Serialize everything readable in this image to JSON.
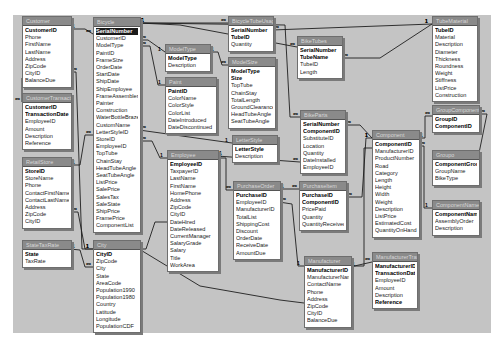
{
  "diagram": {
    "type": "database-relationships",
    "background_color": "#c4c4c4",
    "tables": [
      {
        "id": "customer",
        "title": "Customer",
        "x": 22,
        "y": 16,
        "w": 48,
        "fields": [
          {
            "name": "CustomerID",
            "key": true
          },
          {
            "name": "Phone"
          },
          {
            "name": "FirstName"
          },
          {
            "name": "LastName"
          },
          {
            "name": "Address"
          },
          {
            "name": "ZipCode"
          },
          {
            "name": "CityID"
          },
          {
            "name": "BalanceDue"
          }
        ]
      },
      {
        "id": "customertransaction",
        "title": "CustomerTransaction",
        "x": 22,
        "y": 93,
        "w": 48,
        "fields": [
          {
            "name": "CustomerID",
            "key": true
          },
          {
            "name": "TransactionDate",
            "key": true
          },
          {
            "name": "EmployeeID"
          },
          {
            "name": "Amount"
          },
          {
            "name": "Description"
          },
          {
            "name": "Reference"
          }
        ]
      },
      {
        "id": "retailstore",
        "title": "RetailStore",
        "x": 22,
        "y": 157,
        "w": 48,
        "fields": [
          {
            "name": "StoreID",
            "key": true
          },
          {
            "name": "StoreName"
          },
          {
            "name": "Phone"
          },
          {
            "name": "ContactFirstName"
          },
          {
            "name": "ContactLastName"
          },
          {
            "name": "Address"
          },
          {
            "name": "ZipCode"
          },
          {
            "name": "CityID"
          }
        ]
      },
      {
        "id": "statetaxrate",
        "title": "StateTaxRate",
        "x": 22,
        "y": 240,
        "w": 48,
        "fields": [
          {
            "name": "State",
            "key": true
          },
          {
            "name": "TaxRate"
          }
        ]
      },
      {
        "id": "bicycle",
        "title": "Bicycle",
        "x": 93,
        "y": 17,
        "w": 46,
        "fields": [
          {
            "name": "SerialNumber",
            "key": true,
            "selected": true
          },
          {
            "name": "CustomerID"
          },
          {
            "name": "ModelType"
          },
          {
            "name": "PaintID"
          },
          {
            "name": "FrameSize"
          },
          {
            "name": "OrderDate"
          },
          {
            "name": "StartDate"
          },
          {
            "name": "ShipDate"
          },
          {
            "name": "ShipEmployee"
          },
          {
            "name": "FrameAssembler"
          },
          {
            "name": "Painter"
          },
          {
            "name": "Construction"
          },
          {
            "name": "WaterBottleBrazeOn"
          },
          {
            "name": "CustomName"
          },
          {
            "name": "LetterStyleID"
          },
          {
            "name": "StoreID"
          },
          {
            "name": "EmployeeID"
          },
          {
            "name": "TopTube"
          },
          {
            "name": "ChainStay"
          },
          {
            "name": "HeadTubeAngle"
          },
          {
            "name": "SeatTubeAngle"
          },
          {
            "name": "ListPrice"
          },
          {
            "name": "SalePrice"
          },
          {
            "name": "SalesTax"
          },
          {
            "name": "SaleState"
          },
          {
            "name": "ShipPrice"
          },
          {
            "name": "FramePrice"
          },
          {
            "name": "ComponentList"
          }
        ]
      },
      {
        "id": "city",
        "title": "City",
        "x": 93,
        "y": 240,
        "w": 46,
        "fields": [
          {
            "name": "CityID",
            "key": true
          },
          {
            "name": "ZipCode"
          },
          {
            "name": "City"
          },
          {
            "name": "State"
          },
          {
            "name": "AreaCode"
          },
          {
            "name": "Population1990"
          },
          {
            "name": "Population1980"
          },
          {
            "name": "Country"
          },
          {
            "name": "Latitude"
          },
          {
            "name": "Longitude"
          },
          {
            "name": "PopulationCDF"
          }
        ]
      },
      {
        "id": "modeltype",
        "title": "ModelType",
        "x": 165,
        "y": 44,
        "w": 44,
        "fields": [
          {
            "name": "ModelType",
            "key": true
          },
          {
            "name": "Description"
          }
        ]
      },
      {
        "id": "paint",
        "title": "Paint",
        "x": 165,
        "y": 77,
        "w": 50,
        "fields": [
          {
            "name": "PaintID",
            "key": true
          },
          {
            "name": "ColorName"
          },
          {
            "name": "ColorStyle"
          },
          {
            "name": "ColorList"
          },
          {
            "name": "DateIntroduced"
          },
          {
            "name": "DateDiscontinued"
          }
        ]
      },
      {
        "id": "employee",
        "title": "Employee",
        "x": 167,
        "y": 150,
        "w": 50,
        "fields": [
          {
            "name": "EmployeeID",
            "key": true
          },
          {
            "name": "TaxpayerID"
          },
          {
            "name": "LastName"
          },
          {
            "name": "FirstName"
          },
          {
            "name": "HomePhone"
          },
          {
            "name": "Address"
          },
          {
            "name": "ZipCode"
          },
          {
            "name": "CityID"
          },
          {
            "name": "DateHired"
          },
          {
            "name": "DateReleased"
          },
          {
            "name": "CurrentManager"
          },
          {
            "name": "SalaryGrade"
          },
          {
            "name": "Salary"
          },
          {
            "name": "Title"
          },
          {
            "name": "WorkArea"
          }
        ]
      },
      {
        "id": "bicycletubeusage",
        "title": "BicycleTubeUsage",
        "x": 228,
        "y": 16,
        "w": 44,
        "fields": [
          {
            "name": "SerialNumber",
            "key": true
          },
          {
            "name": "TubeID",
            "key": true
          },
          {
            "name": "Quantity"
          }
        ]
      },
      {
        "id": "modelsize",
        "title": "ModelSize",
        "x": 228,
        "y": 57,
        "w": 46,
        "fields": [
          {
            "name": "ModelType",
            "key": true
          },
          {
            "name": "Size",
            "key": true
          },
          {
            "name": "TopTube"
          },
          {
            "name": "ChainStay"
          },
          {
            "name": "TotalLength"
          },
          {
            "name": "GroundClearance"
          },
          {
            "name": "HeadTubeAngle"
          },
          {
            "name": "SeatTubeAngle"
          }
        ]
      },
      {
        "id": "letterstyle",
        "title": "LetterStyle",
        "x": 232,
        "y": 135,
        "w": 44,
        "fields": [
          {
            "name": "LetterStyle",
            "key": true
          },
          {
            "name": "Description"
          }
        ]
      },
      {
        "id": "purchaseorder",
        "title": "PurchaseOrder",
        "x": 233,
        "y": 181,
        "w": 46,
        "fields": [
          {
            "name": "PurchaseID",
            "key": true
          },
          {
            "name": "EmployeeID"
          },
          {
            "name": "ManufacturerID"
          },
          {
            "name": "TotalList"
          },
          {
            "name": "ShippingCost"
          },
          {
            "name": "Discount"
          },
          {
            "name": "OrderDate"
          },
          {
            "name": "ReceiveDate"
          },
          {
            "name": "AmountDue"
          }
        ]
      },
      {
        "id": "biketubes",
        "title": "BikeTubes",
        "x": 297,
        "y": 36,
        "w": 44,
        "fields": [
          {
            "name": "SerialNumber",
            "key": true
          },
          {
            "name": "TubeName",
            "key": true
          },
          {
            "name": "TubeID"
          },
          {
            "name": "Length"
          }
        ]
      },
      {
        "id": "bikeparts",
        "title": "BikeParts",
        "x": 300,
        "y": 110,
        "w": 44,
        "fields": [
          {
            "name": "SerialNumber",
            "key": true
          },
          {
            "name": "ComponentID",
            "key": true
          },
          {
            "name": "SubstituteID"
          },
          {
            "name": "Location"
          },
          {
            "name": "Quantity"
          },
          {
            "name": "DateInstalled"
          },
          {
            "name": "EmployeeID"
          }
        ]
      },
      {
        "id": "purchaseitem",
        "title": "PurchaseItem",
        "x": 299,
        "y": 181,
        "w": 46,
        "fields": [
          {
            "name": "PurchaseID",
            "key": true
          },
          {
            "name": "ComponentID",
            "key": true
          },
          {
            "name": "PricePaid"
          },
          {
            "name": "Quantity"
          },
          {
            "name": "QuantityReceived"
          }
        ]
      },
      {
        "id": "manufacturer",
        "title": "Manufacturer",
        "x": 304,
        "y": 256,
        "w": 46,
        "fields": [
          {
            "name": "ManufacturerID",
            "key": true
          },
          {
            "name": "ManufacturerName"
          },
          {
            "name": "ContactName"
          },
          {
            "name": "Phone"
          },
          {
            "name": "Address"
          },
          {
            "name": "ZipCode"
          },
          {
            "name": "CityID"
          },
          {
            "name": "BalanceDue"
          }
        ]
      },
      {
        "id": "component",
        "title": "Component",
        "x": 372,
        "y": 130,
        "w": 46,
        "fields": [
          {
            "name": "ComponentID",
            "key": true
          },
          {
            "name": "ManufacturerID"
          },
          {
            "name": "ProductNumber"
          },
          {
            "name": "Road"
          },
          {
            "name": "Category"
          },
          {
            "name": "Length"
          },
          {
            "name": "Height"
          },
          {
            "name": "Width"
          },
          {
            "name": "Weight"
          },
          {
            "name": "Description"
          },
          {
            "name": "ListPrice"
          },
          {
            "name": "EstimatedCost"
          },
          {
            "name": "QuantityOnHand"
          }
        ]
      },
      {
        "id": "manufacturertransaction",
        "title": "ManufacturerTransaction",
        "x": 372,
        "y": 252,
        "w": 44,
        "fields": [
          {
            "name": "ManufacturerID",
            "key": true
          },
          {
            "name": "TransactionDate",
            "key": true
          },
          {
            "name": "EmployeeID"
          },
          {
            "name": "Amount"
          },
          {
            "name": "Description"
          },
          {
            "name": "Reference",
            "key": true
          }
        ]
      },
      {
        "id": "tubematerial",
        "title": "TubeMaterial",
        "x": 432,
        "y": 16,
        "w": 44,
        "fields": [
          {
            "name": "TubeID",
            "key": true
          },
          {
            "name": "Material"
          },
          {
            "name": "Description"
          },
          {
            "name": "Diameter"
          },
          {
            "name": "Thickness"
          },
          {
            "name": "Roundness"
          },
          {
            "name": "Weight"
          },
          {
            "name": "Stiffness"
          },
          {
            "name": "ListPrice"
          },
          {
            "name": "Construction"
          }
        ]
      },
      {
        "id": "groupcomponents",
        "title": "GroupComponents",
        "x": 432,
        "y": 105,
        "w": 46,
        "fields": [
          {
            "name": "GroupID",
            "key": true
          },
          {
            "name": "ComponentID",
            "key": true
          }
        ]
      },
      {
        "id": "groupo",
        "title": "Groupo",
        "x": 432,
        "y": 150,
        "w": 46,
        "fields": [
          {
            "name": "ComponentGroupID",
            "key": true
          },
          {
            "name": "GroupName"
          },
          {
            "name": "BikeType"
          }
        ]
      },
      {
        "id": "componentname",
        "title": "ComponentName",
        "x": 432,
        "y": 200,
        "w": 46,
        "fields": [
          {
            "name": "ComponentName",
            "key": true
          },
          {
            "name": "AssemblyOrder"
          },
          {
            "name": "Description"
          }
        ]
      }
    ],
    "relationships": [
      {
        "from": "customer",
        "to": "bicycle",
        "from_card": "1",
        "to_card": "∞",
        "path": "70,29 85,29 93,34"
      },
      {
        "from": "customer",
        "to": "customertransaction",
        "from_card": "1",
        "to_card": "∞",
        "path": "22,78 22,102"
      },
      {
        "from": "bicycle",
        "to": "bicycletubeusage",
        "from_card": "1",
        "to_card": "∞",
        "path": "139,23 228,23"
      },
      {
        "from": "bicycle",
        "to": "biketubes",
        "from_card": "1",
        "to_card": "∞",
        "path": "139,23 180,25 297,47"
      },
      {
        "from": "bicycle",
        "to": "modeltype",
        "from_card": "∞",
        "to_card": "1",
        "path": "139,40 148,40 165,52"
      },
      {
        "from": "bicycle",
        "to": "paint",
        "from_card": "∞",
        "to_card": "1",
        "path": "139,46 150,46 158,85 165,85"
      },
      {
        "from": "bicycle",
        "to": "letterstyle",
        "from_card": "∞",
        "to_card": "1",
        "path": "139,130 232,143"
      },
      {
        "from": "bicycle",
        "to": "employee",
        "from_card": "∞",
        "to_card": "1",
        "path": "139,141 152,141 160,158 167,158"
      },
      {
        "from": "bicycle",
        "to": "bikeparts",
        "from_card": "1",
        "to_card": "∞",
        "path": "139,23 285,25 290,117 300,117"
      },
      {
        "from": "retailstore",
        "to": "bicycle",
        "from_card": "1",
        "to_card": "∞",
        "path": "70,165 80,165 85,135 93,135"
      },
      {
        "from": "retailstore",
        "to": "city",
        "from_card": "∞",
        "to_card": "1",
        "path": "70,212 78,212 85,249 93,249"
      },
      {
        "from": "statetaxrate",
        "to": "city",
        "from_card": "1",
        "to_card": "∞",
        "path": "70,249 80,250 85,267 93,267"
      },
      {
        "from": "customer",
        "to": "city",
        "from_card": "∞",
        "to_card": "1",
        "path": "70,72 76,72 82,249 93,249"
      },
      {
        "from": "employee",
        "to": "city",
        "from_card": "∞",
        "to_card": "1",
        "path": "167,222 155,222 146,249 139,249"
      },
      {
        "from": "modeltype",
        "to": "modelsize",
        "from_card": "1",
        "to_card": "∞",
        "path": "209,52 218,52 222,65 228,65"
      },
      {
        "from": "bicycletubeusage",
        "to": "tubematerial",
        "from_card": "∞",
        "to_card": "1",
        "path": "272,30 432,24"
      },
      {
        "from": "biketubes",
        "to": "tubematerial",
        "from_card": "∞",
        "to_card": "1",
        "path": "341,58 380,58 432,24"
      },
      {
        "from": "employee",
        "to": "purchaseorder",
        "from_card": "1",
        "to_card": "∞",
        "path": "217,158 226,158 226,190 233,190"
      },
      {
        "from": "employee",
        "to": "bikeparts",
        "from_card": "1",
        "to_card": "∞",
        "path": "217,156 300,162"
      },
      {
        "from": "purchaseorder",
        "to": "purchaseitem",
        "from_card": "1",
        "to_card": "∞",
        "path": "279,189 299,189"
      },
      {
        "from": "purchaseorder",
        "to": "manufacturer",
        "from_card": "∞",
        "to_card": "1",
        "path": "279,202 292,204 298,266 304,266"
      },
      {
        "from": "bikeparts",
        "to": "component",
        "from_card": "∞",
        "to_card": "1",
        "path": "344,125 360,125 372,138"
      },
      {
        "from": "purchaseitem",
        "to": "component",
        "from_card": "∞",
        "to_card": "1",
        "path": "345,197 362,197 366,138 372,138"
      },
      {
        "from": "component",
        "to": "manufacturer",
        "from_card": "∞",
        "to_card": "1",
        "path": "372,148 364,148 364,266 350,266"
      },
      {
        "from": "manufacturer",
        "to": "manufacturertransaction",
        "from_card": "1",
        "to_card": "∞",
        "path": "350,267 372,262"
      },
      {
        "from": "component",
        "to": "groupcomponents",
        "from_card": "1",
        "to_card": "∞",
        "path": "418,138 425,138 425,116 432,116"
      },
      {
        "from": "component",
        "to": "componentname",
        "from_card": "∞",
        "to_card": "1",
        "path": "418,146 424,146 424,208 432,208"
      },
      {
        "from": "groupcomponents",
        "to": "groupo",
        "from_card": "∞",
        "to_card": "1",
        "path": "478,114 487,114 478,158"
      },
      {
        "from": "manufacturer",
        "to": "city",
        "from_card": "∞",
        "to_card": "1",
        "path": "304,303 280,300 200,286 139,249"
      }
    ]
  }
}
